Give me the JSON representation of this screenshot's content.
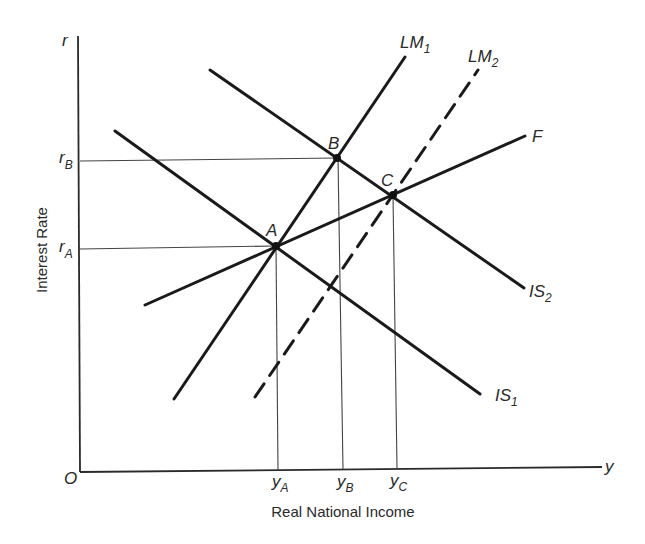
{
  "diagram": {
    "type": "IS-LM model",
    "axes": {
      "y_axis_symbol": "r",
      "x_axis_symbol": "y",
      "origin": "O",
      "y_axis_title": "Interest Rate",
      "x_axis_title": "Real National Income"
    },
    "curves": [
      {
        "id": "LM1",
        "label": "LM",
        "sub": "1",
        "style": "solid"
      },
      {
        "id": "LM2",
        "label": "LM",
        "sub": "2",
        "style": "dashed"
      },
      {
        "id": "F",
        "label": "F",
        "sub": "",
        "style": "solid"
      },
      {
        "id": "IS2",
        "label": "IS",
        "sub": "2",
        "style": "solid"
      },
      {
        "id": "IS1",
        "label": "IS",
        "sub": "1",
        "style": "solid"
      }
    ],
    "points": [
      {
        "id": "A",
        "label": "A"
      },
      {
        "id": "B",
        "label": "B"
      },
      {
        "id": "C",
        "label": "C"
      }
    ],
    "y_ticks": [
      {
        "label": "r",
        "sub": "B"
      },
      {
        "label": "r",
        "sub": "A"
      }
    ],
    "x_ticks": [
      {
        "label": "y",
        "sub": "A"
      },
      {
        "label": "y",
        "sub": "B"
      },
      {
        "label": "y",
        "sub": "C"
      }
    ]
  }
}
